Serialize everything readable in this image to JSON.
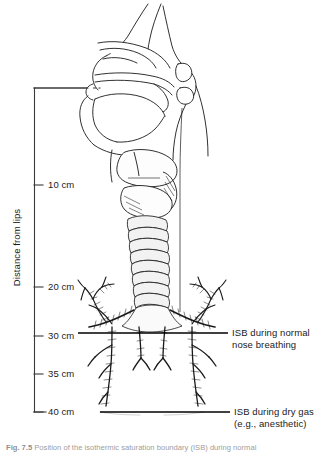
{
  "figure": {
    "axis": {
      "title": "Distance from lips",
      "unit": "cm",
      "ticks": [
        {
          "label": "10 cm",
          "value": 10
        },
        {
          "label": "20 cm",
          "value": 20
        },
        {
          "label": "30 cm",
          "value": 30
        },
        {
          "label": "35 cm",
          "value": 35
        },
        {
          "label": "40 cm",
          "value": 40
        }
      ]
    },
    "annotations": [
      {
        "id": "isb-normal",
        "line1": "ISB during normal",
        "line2": "nose breathing",
        "at_cm": 30
      },
      {
        "id": "isb-dry-gas",
        "line1": "ISB during dry gas",
        "line2": "(e.g., anesthetic)",
        "at_cm": 40
      }
    ],
    "caption": {
      "number": "Fig. 7.5",
      "text": "Position of the isothermic saturation boundary (ISB) during normal"
    },
    "colors": {
      "ink": "#1a1a1a",
      "line": "#000000",
      "background": "#ffffff"
    }
  }
}
